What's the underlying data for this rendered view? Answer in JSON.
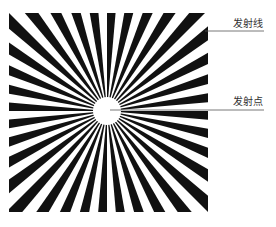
{
  "diagram": {
    "title": "",
    "shape": "radial-burst",
    "colors": {
      "ray": "#111111",
      "background": "#ffffff",
      "leader_line": "#555555",
      "text": "#333333"
    },
    "square": {
      "x": 9,
      "y": 13,
      "width": 199,
      "height": 199
    },
    "center": {
      "x": 107,
      "y": 111
    },
    "ray_count": 36,
    "inner_radius": 14
  },
  "labels": [
    {
      "id": "emission-line",
      "text": "发射线",
      "x": 233,
      "y": 18,
      "leader": {
        "x1": 205,
        "y1": 31,
        "x2": 264,
        "y2": 31
      }
    },
    {
      "id": "emission-point",
      "text": "发射点",
      "x": 233,
      "y": 96,
      "leader": {
        "x1": 110,
        "y1": 110,
        "x2": 264,
        "y2": 110
      }
    }
  ]
}
